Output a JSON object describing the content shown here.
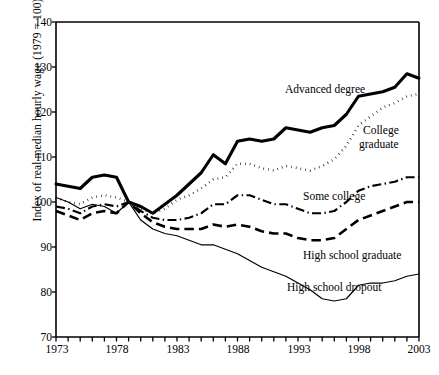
{
  "chart_data": {
    "type": "line",
    "title": "",
    "xlabel": "",
    "ylabel": "Index of real median hourly wage (1979 = 100)",
    "xlim": [
      1973,
      2003
    ],
    "ylim": [
      70,
      140
    ],
    "yticks": [
      70,
      80,
      90,
      100,
      110,
      120,
      130,
      140
    ],
    "xticks_labeled": [
      1973,
      1978,
      1983,
      1988,
      1993,
      1998,
      2003
    ],
    "xtick_step_minor": 1,
    "grid": false,
    "legend_position": "inline-annotations",
    "x": [
      1973,
      1974,
      1975,
      1976,
      1977,
      1978,
      1979,
      1980,
      1981,
      1982,
      1983,
      1984,
      1985,
      1986,
      1987,
      1988,
      1989,
      1990,
      1991,
      1992,
      1993,
      1994,
      1995,
      1996,
      1997,
      1998,
      1999,
      2000,
      2001,
      2002,
      2003
    ],
    "series": [
      {
        "name": "Advanced degree",
        "style": "solid-thick",
        "values": [
          104.0,
          103.5,
          103.0,
          105.5,
          106.0,
          105.5,
          100.0,
          99.0,
          97.5,
          99.5,
          101.5,
          104.0,
          106.5,
          110.5,
          108.5,
          113.5,
          114.0,
          113.5,
          114.0,
          116.5,
          116.0,
          115.5,
          116.5,
          117.0,
          119.5,
          123.5,
          124.0,
          124.5,
          125.5,
          128.5,
          127.5
        ]
      },
      {
        "name": "College graduate",
        "style": "dotted",
        "values": [
          101.0,
          100.0,
          99.5,
          101.0,
          101.5,
          101.0,
          100.0,
          98.5,
          97.5,
          98.5,
          100.5,
          101.5,
          103.0,
          105.0,
          105.5,
          108.5,
          108.5,
          107.5,
          107.0,
          108.0,
          107.5,
          107.0,
          108.0,
          109.5,
          112.5,
          117.0,
          119.0,
          121.0,
          122.0,
          123.5,
          124.0
        ]
      },
      {
        "name": "Some college",
        "style": "dash-dot",
        "values": [
          99.0,
          98.5,
          97.5,
          99.0,
          99.5,
          99.0,
          100.0,
          98.0,
          96.5,
          96.0,
          96.0,
          96.5,
          97.5,
          99.5,
          99.5,
          101.5,
          101.5,
          100.5,
          99.5,
          99.5,
          98.5,
          97.5,
          97.5,
          98.0,
          100.0,
          102.5,
          103.5,
          104.0,
          104.5,
          105.5,
          105.5
        ]
      },
      {
        "name": "High school graduate",
        "style": "dashed",
        "values": [
          98.0,
          97.0,
          96.0,
          97.5,
          98.0,
          97.5,
          100.0,
          97.5,
          95.5,
          94.5,
          94.0,
          94.0,
          94.0,
          95.0,
          94.5,
          95.0,
          94.5,
          93.5,
          93.0,
          93.0,
          92.0,
          91.5,
          91.5,
          92.0,
          94.0,
          96.0,
          97.0,
          98.0,
          99.0,
          100.0,
          100.0
        ]
      },
      {
        "name": "High school dropout",
        "style": "solid-thin",
        "values": [
          101.0,
          100.0,
          98.5,
          99.5,
          99.0,
          97.5,
          100.0,
          96.0,
          94.0,
          93.0,
          92.5,
          91.5,
          90.5,
          90.5,
          89.5,
          88.5,
          87.0,
          85.5,
          84.5,
          83.5,
          82.0,
          80.5,
          78.5,
          78.0,
          78.5,
          81.5,
          82.0,
          82.0,
          82.5,
          83.5,
          84.0
        ]
      }
    ]
  },
  "axes": {
    "ylabel": "Index of real median hourly wage (1979 = 100)",
    "ytick_labels": [
      "140",
      "130",
      "120",
      "110",
      "100",
      "90",
      "80",
      "70"
    ],
    "xtick_labels": [
      "1973",
      "1978",
      "1983",
      "1988",
      "1993",
      "1998",
      "2003"
    ]
  },
  "annotations": {
    "advanced_degree": "Advanced degree",
    "college_graduate_line1": "College",
    "college_graduate_line2": "graduate",
    "some_college": "Some college",
    "high_school_graduate": "High school graduate",
    "high_school_dropout": "High school dropout"
  }
}
